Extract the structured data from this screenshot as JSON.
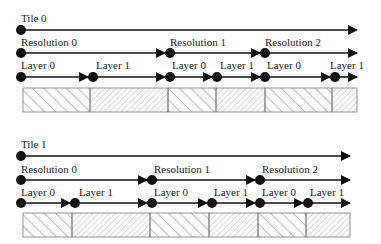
{
  "tiles": [
    {
      "label": "Tile 0",
      "resolutions": [
        "Resolution 0",
        "Resolution 1",
        "Resolution 2"
      ],
      "layers": [
        "Layer 0",
        "Layer 1",
        "Layer 0",
        "Layer 1",
        "Layer 0",
        "Layer 1"
      ]
    },
    {
      "label": "Tile 1",
      "resolutions": [
        "Resolution 0",
        "Resolution 1",
        "Resolution 2"
      ],
      "layers": [
        "Layer 0",
        "Layer 1",
        "Layer 0",
        "Layer 1",
        "Layer 0",
        "Layer 1"
      ]
    }
  ],
  "colors": {
    "line": "#111111",
    "hatch": "#555555",
    "box_border": "#777777"
  }
}
